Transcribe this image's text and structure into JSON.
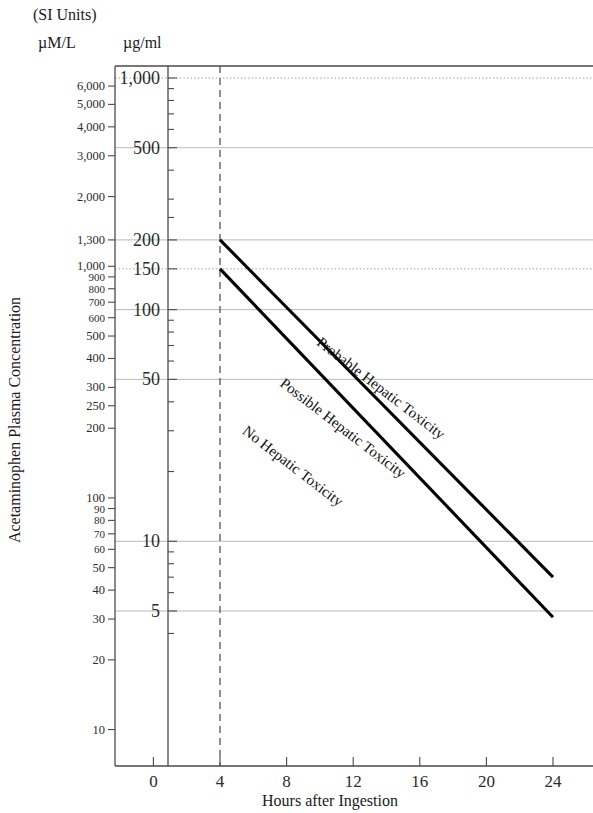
{
  "header": {
    "si_units": "(SI Units)",
    "left_unit": "µM/L",
    "right_unit": "µg/ml"
  },
  "axes": {
    "y_title": "Acetaminophen Plasma Concentration",
    "x_title": "Hours after Ingestion"
  },
  "chart_data": {
    "type": "line",
    "xlabel": "Hours after Ingestion",
    "ylabel": "Acetaminophen Plasma Concentration",
    "x_scale": "linear",
    "y_scale": "log",
    "xlim": [
      0,
      25.5
    ],
    "ylim_ug_ml": [
      3.0,
      1100
    ],
    "ylim_umol_l": [
      9.8,
      7300
    ],
    "grid": true,
    "legend": "none",
    "x_ticks": [
      "0",
      "4",
      "8",
      "12",
      "16",
      "20",
      "24"
    ],
    "x_tick_values": [
      0,
      4,
      8,
      12,
      16,
      20,
      24
    ],
    "y_ticks_ug_ml": [
      "1,000",
      "500",
      "200",
      "150",
      "100",
      "50",
      "10",
      "5"
    ],
    "y_tick_values_ug_ml": [
      1000,
      500,
      200,
      150,
      100,
      50,
      10,
      5
    ],
    "y_ticks_umol_l": [
      "6,000",
      "5,000",
      "4,000",
      "3,000",
      "2,000",
      "1,300",
      "1,000",
      "900",
      "800",
      "700",
      "600",
      "500",
      "400",
      "300",
      "250",
      "200",
      "100",
      "90",
      "80",
      "70",
      "60",
      "50",
      "40",
      "30",
      "20",
      "10"
    ],
    "y_tick_values_umol_l": [
      6000,
      5000,
      4000,
      3000,
      2000,
      1300,
      1000,
      900,
      800,
      700,
      600,
      500,
      400,
      300,
      250,
      200,
      100,
      90,
      80,
      70,
      60,
      50,
      40,
      30,
      20,
      10
    ],
    "gridlines_ug_ml": [
      {
        "value": 1000,
        "style": "dotted"
      },
      {
        "value": 500,
        "style": "solid"
      },
      {
        "value": 200,
        "style": "solid"
      },
      {
        "value": 150,
        "style": "dotted"
      },
      {
        "value": 100,
        "style": "solid"
      },
      {
        "value": 50,
        "style": "solid"
      },
      {
        "value": 10,
        "style": "solid"
      },
      {
        "value": 5,
        "style": "solid"
      }
    ],
    "vertical_marker": {
      "x": 4,
      "style": "dashed",
      "label": "4 hours"
    },
    "series": [
      {
        "name": "Probable Hepatic Toxicity line",
        "points": [
          {
            "x": 4,
            "y_ug_ml": 200
          },
          {
            "x": 24,
            "y_ug_ml": 7.0
          }
        ],
        "style": "solid-thick"
      },
      {
        "name": "Possible Hepatic Toxicity line",
        "points": [
          {
            "x": 4,
            "y_ug_ml": 150
          },
          {
            "x": 24,
            "y_ug_ml": 4.7
          }
        ],
        "style": "solid-thick"
      }
    ],
    "zone_labels": [
      {
        "text": "Probable Hepatic Toxicity",
        "region": "above upper line"
      },
      {
        "text": "Possible Hepatic Toxicity",
        "region": "between lines"
      },
      {
        "text": "No Hepatic Toxicity",
        "region": "below lower line"
      }
    ],
    "annotations": [
      "(SI Units)",
      "µM/L",
      "µg/ml"
    ]
  },
  "colors": {
    "line": "#000000",
    "grid": "#b9b9b9",
    "axis": "#4a4a4a",
    "background": "#ffffff"
  }
}
